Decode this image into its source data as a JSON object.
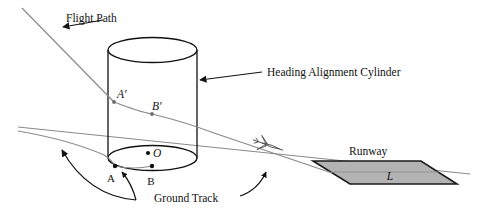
{
  "figure": {
    "type": "technical-diagram",
    "background_color": "#ffffff",
    "line_color": "#3c3c3c",
    "dark_line_color": "#111111",
    "runway_fill": "#b3b3b3",
    "runway_stroke": "#1a1a1a"
  },
  "labels": {
    "flight_path": "Flight Path",
    "heading_alignment_cylinder": "Heading Alignment Cylinder",
    "ground_track": "Ground Track",
    "runway": "Runway",
    "runway_length": "L",
    "point_a_prime": "A′",
    "point_b_prime": "B′",
    "point_a": "A",
    "point_b": "B",
    "point_o": "O"
  },
  "geometry": {
    "cylinder": {
      "left_x": 108,
      "right_x": 197,
      "top_center_y": 50,
      "bottom_center_y": 158,
      "rx": 44.5,
      "ry": 12.5
    },
    "flight_path_start": [
      22,
      8
    ],
    "flight_path_end": [
      330,
      172
    ],
    "ground_track_start": [
      18,
      127
    ],
    "ground_track_end": [
      470,
      174
    ],
    "runway_corners": [
      [
        313,
        161
      ],
      [
        421,
        161
      ],
      [
        457,
        184
      ],
      [
        350,
        184
      ]
    ],
    "points": {
      "A_prime": [
        114,
        102
      ],
      "B_prime": [
        152,
        114
      ],
      "A": [
        115,
        166
      ],
      "B": [
        152,
        166
      ],
      "O": [
        148,
        153
      ]
    },
    "aircraft_position": [
      268,
      145
    ]
  }
}
